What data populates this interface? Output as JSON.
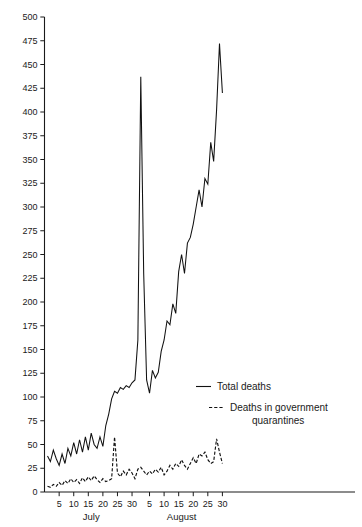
{
  "chart_data": {
    "type": "line",
    "title": "",
    "subtitle": "",
    "xlabel": "",
    "ylabel": "",
    "xlim": [
      1,
      62
    ],
    "ylim": [
      0,
      500
    ],
    "grid": false,
    "legend_position": "inside-middle-right",
    "y_ticks": [
      0,
      25,
      50,
      75,
      100,
      125,
      150,
      175,
      200,
      225,
      250,
      275,
      300,
      325,
      350,
      375,
      400,
      425,
      450,
      475,
      500
    ],
    "y_tick_labels": [
      "0",
      "25",
      "50",
      "75",
      "100",
      "125",
      "150",
      "175",
      "200",
      "225",
      "250",
      "275",
      "300",
      "325",
      "350",
      "375",
      "400",
      "425",
      "450",
      "475",
      "500"
    ],
    "x_months": [
      {
        "name": "July",
        "start_day": 1,
        "end_day": 31,
        "ticks": [
          5,
          10,
          15,
          20,
          25,
          30
        ]
      },
      {
        "name": "August",
        "start_day": 1,
        "end_day": 31,
        "ticks": [
          5,
          10,
          15,
          20,
          25,
          30
        ]
      }
    ],
    "x_tick_labels": [
      "5",
      "10",
      "15",
      "20",
      "25",
      "30",
      "5",
      "10",
      "15",
      "20",
      "25",
      "30"
    ],
    "x_days": [
      "Jul 1",
      "Jul 2",
      "Jul 3",
      "Jul 4",
      "Jul 5",
      "Jul 6",
      "Jul 7",
      "Jul 8",
      "Jul 9",
      "Jul 10",
      "Jul 11",
      "Jul 12",
      "Jul 13",
      "Jul 14",
      "Jul 15",
      "Jul 16",
      "Jul 17",
      "Jul 18",
      "Jul 19",
      "Jul 20",
      "Jul 21",
      "Jul 22",
      "Jul 23",
      "Jul 24",
      "Jul 25",
      "Jul 26",
      "Jul 27",
      "Jul 28",
      "Jul 29",
      "Jul 30",
      "Jul 31",
      "Aug 1",
      "Aug 2",
      "Aug 3",
      "Aug 4",
      "Aug 5",
      "Aug 6",
      "Aug 7",
      "Aug 8",
      "Aug 9",
      "Aug 10",
      "Aug 11",
      "Aug 12",
      "Aug 13",
      "Aug 14",
      "Aug 15",
      "Aug 16",
      "Aug 17",
      "Aug 18",
      "Aug 19",
      "Aug 20",
      "Aug 21",
      "Aug 22",
      "Aug 23",
      "Aug 24",
      "Aug 25",
      "Aug 26",
      "Aug 27",
      "Aug 28",
      "Aug 29",
      "Aug 30",
      "Aug 31"
    ],
    "series": [
      {
        "name": "Total deaths",
        "style": "solid",
        "color": "#111111",
        "values": [
          38,
          32,
          44,
          35,
          28,
          40,
          30,
          46,
          38,
          52,
          40,
          55,
          42,
          58,
          44,
          62,
          50,
          46,
          58,
          48,
          70,
          82,
          98,
          106,
          104,
          110,
          108,
          112,
          110,
          115,
          118,
          160,
          437,
          230,
          118,
          104,
          128,
          120,
          126,
          148,
          160,
          180,
          176,
          198,
          188,
          232,
          250,
          230,
          262,
          268,
          282,
          300,
          318,
          300,
          330,
          324,
          368,
          348,
          402,
          472,
          420
        ]
      },
      {
        "name": "Deaths in government quarantines",
        "style": "dashed",
        "color": "#111111",
        "values": [
          6,
          5,
          8,
          6,
          10,
          7,
          12,
          9,
          14,
          10,
          13,
          9,
          15,
          11,
          16,
          12,
          17,
          13,
          10,
          14,
          11,
          12,
          14,
          58,
          20,
          16,
          22,
          18,
          24,
          20,
          14,
          24,
          26,
          22,
          18,
          22,
          19,
          24,
          21,
          26,
          18,
          22,
          28,
          24,
          30,
          27,
          34,
          28,
          24,
          30,
          36,
          30,
          40,
          38,
          42,
          34,
          30,
          32,
          56,
          42,
          30
        ]
      }
    ]
  },
  "legend": {
    "entries": [
      {
        "label": "Total deaths",
        "style": "solid"
      },
      {
        "label": "Deaths in  government",
        "label2": "quarantines",
        "style": "dashed"
      }
    ]
  }
}
